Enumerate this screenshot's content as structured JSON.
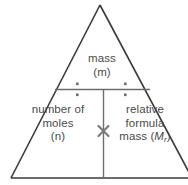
{
  "diagram": {
    "type": "formula-triangle",
    "background_color": "#ffffff",
    "outline_color": "#3a3a3a",
    "divider_color": "#6d6d6d",
    "text_color": "#4a4a4a",
    "operator_color": "#6d6d6d"
  },
  "cells": {
    "top": {
      "name": "mass",
      "line1": "mass",
      "line2": "(m)",
      "symbol": "m"
    },
    "bottom_left": {
      "name": "number of moles",
      "line1": "number of",
      "line2": "moles",
      "line3": "(n)",
      "symbol": "n"
    },
    "bottom_right": {
      "name": "relative formula mass",
      "line1": "relative",
      "line2": "formula",
      "line3_prefix": "mass (",
      "line3_symbol": "M",
      "line3_subscript": "r",
      "line3_suffix": ")"
    }
  },
  "operators": {
    "divide_left": "÷",
    "divide_right": "÷",
    "multiply": "×"
  }
}
